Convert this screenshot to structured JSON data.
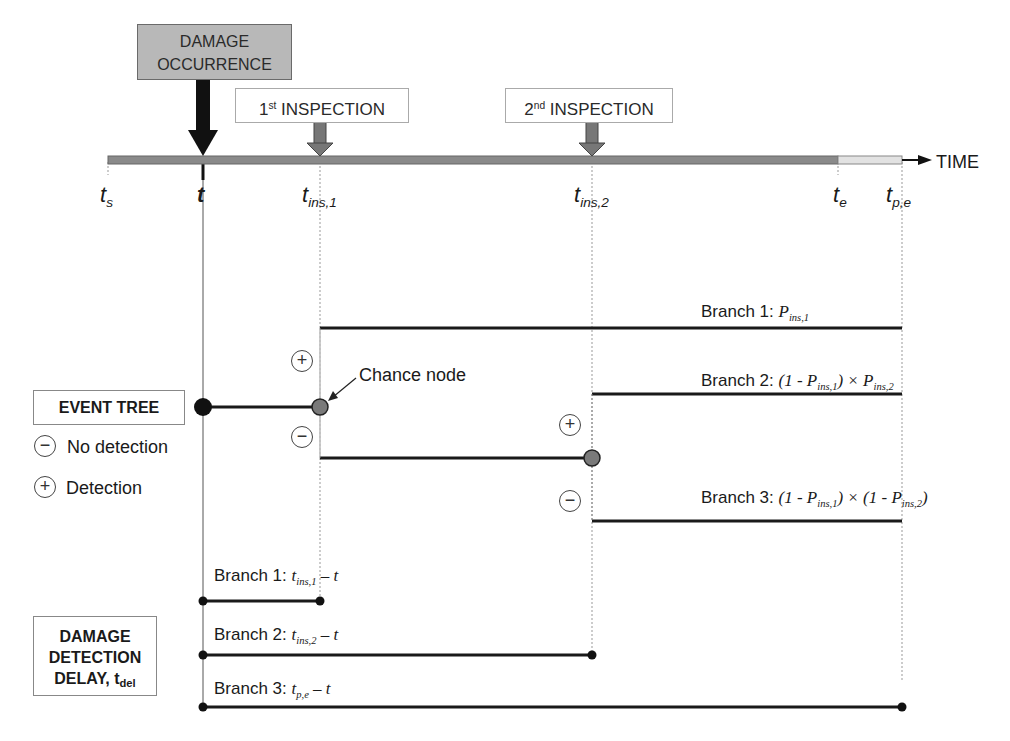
{
  "diagram": {
    "damage_box": {
      "line1": "DAMAGE",
      "line2": "OCCURRENCE"
    },
    "inspections": [
      {
        "ord": "1",
        "sup": "st",
        "label": " INSPECTION"
      },
      {
        "ord": "2",
        "sup": "nd",
        "label": " INSPECTION"
      }
    ],
    "time_axis": {
      "label": "TIME",
      "ticks": [
        {
          "main": "t",
          "sub": "s"
        },
        {
          "main": "t",
          "sub": ""
        },
        {
          "main": "t",
          "sub": "ins,1"
        },
        {
          "main": "t",
          "sub": "ins,2"
        },
        {
          "main": "t",
          "sub": "e"
        },
        {
          "main": "t",
          "sub": "p,e"
        }
      ]
    },
    "event_tree": {
      "title": "EVENT TREE",
      "legend": [
        {
          "symbol": "−",
          "label": "No detection"
        },
        {
          "symbol": "+",
          "label": "Detection"
        }
      ],
      "chance_node_label": "Chance node",
      "branches": [
        {
          "prefix": "Branch 1: ",
          "formula": "P",
          "sub": "ins,1"
        },
        {
          "prefix": "Branch 2: ",
          "a": "(1 - P",
          "a_sub": "ins,1",
          "b": ") × P",
          "b_sub": "ins,2"
        },
        {
          "prefix": "Branch 3: ",
          "a": "(1 - P",
          "a_sub": "ins,1",
          "b": ") × (1 - P",
          "b_sub": "ins,2",
          "c": ")"
        }
      ],
      "plus": "+",
      "minus": "−"
    },
    "delay": {
      "title_line1": "DAMAGE",
      "title_line2": "DETECTION",
      "title_line3": "DELAY, t",
      "title_sub": "del",
      "branches": [
        {
          "prefix": "Branch 1: ",
          "t": "t",
          "sub": "ins,1",
          "rest": " – t"
        },
        {
          "prefix": "Branch 2: ",
          "t": "t",
          "sub": "ins,2",
          "rest": " – t"
        },
        {
          "prefix": "Branch 3: ",
          "t": "t",
          "sub": "p,e",
          "rest": " – t"
        }
      ]
    },
    "colors": {
      "timeline": "#8a8a8a",
      "damage_box": "#b8b8b8",
      "chance_node": "#7a7a7a",
      "root_node": "#1a1a1a"
    }
  }
}
